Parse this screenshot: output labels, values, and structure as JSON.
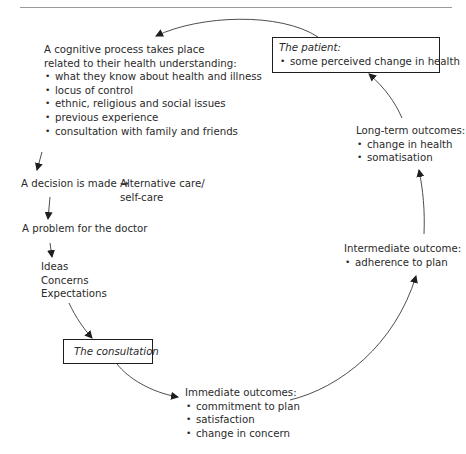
{
  "cognitive": {
    "heading_line1": "A cognitive process takes place",
    "heading_line2": "related to their health understanding:",
    "items": [
      "what they know about health and illness",
      "locus of control",
      "ethnic, religious and social issues",
      "previous experience",
      "consultation with family and friends"
    ]
  },
  "decision": {
    "label": "A decision is made",
    "arrow": "→",
    "alt_line1": "Alternative care/",
    "alt_line2": "self-care"
  },
  "problem": {
    "label": "A problem for the doctor"
  },
  "ice": {
    "items": [
      "Ideas",
      "Concerns",
      "Expectations"
    ]
  },
  "consultation": {
    "label": "The consultation"
  },
  "immediate": {
    "heading": "Immediate outcomes:",
    "items": [
      "commitment to plan",
      "satisfaction",
      "change in concern"
    ]
  },
  "intermediate": {
    "heading": "Intermediate outcome:",
    "items": [
      "adherence to plan"
    ]
  },
  "longterm": {
    "heading": "Long-term outcomes:",
    "items": [
      "change in health",
      "somatisation"
    ]
  },
  "patient": {
    "heading": "The patient:",
    "items": [
      "some perceived change in health"
    ]
  }
}
